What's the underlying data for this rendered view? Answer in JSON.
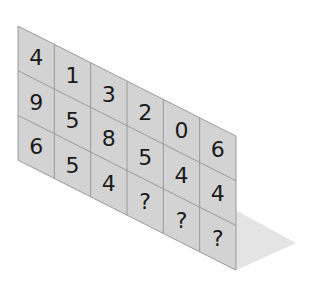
{
  "puzzle": {
    "description": "Number grid puzzle on a sheared panel with missing values",
    "rows": 3,
    "cols": 6,
    "grid": [
      [
        "4",
        "1",
        "3",
        "2",
        "0",
        "6"
      ],
      [
        "9",
        "5",
        "8",
        "5",
        "4",
        "4"
      ],
      [
        "6",
        "5",
        "4",
        "?",
        "?",
        "?"
      ]
    ]
  },
  "colors": {
    "panel_fill": "#d3d3d3",
    "grid_line": "#9a9a9a",
    "floor_fill": "#e4e4e4",
    "text": "#1a1a1a"
  }
}
